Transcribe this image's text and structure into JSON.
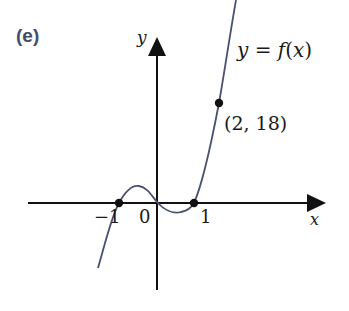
{
  "figure": {
    "part_label": "(e)",
    "axes": {
      "x_label": "x",
      "y_label": "y"
    },
    "curve_label": "y = f(x)",
    "curve_label_parts": {
      "lhs": "y",
      "eq": " = ",
      "fn": "f",
      "open": "(",
      "arg": "x",
      "close": ")"
    },
    "ticks": [
      {
        "label": "−1",
        "value": -1
      },
      {
        "label": "0",
        "value": 0
      },
      {
        "label": "1",
        "value": 1
      }
    ],
    "points": [
      {
        "label": "",
        "x": -1,
        "y": 0,
        "note": "root near -1"
      },
      {
        "label": "",
        "x": 1,
        "y": 0,
        "note": "root near 1"
      },
      {
        "label": "(2, 18)",
        "x": 2,
        "y": 18
      }
    ],
    "curve_color": "#4a5070",
    "axis_color": "#111111",
    "label_color": "#454a6b"
  }
}
